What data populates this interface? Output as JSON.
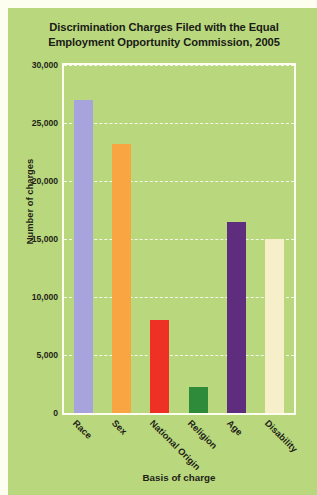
{
  "chart_data": {
    "type": "bar",
    "title": "Discrimination Charges Filed with the Equal Employment Opportunity Commission, 2005",
    "title_lines": [
      "Discrimination Charges Filed with the Equal",
      "Employment Opportunity Commission, 2005"
    ],
    "xlabel": "Basis of charge",
    "ylabel": "Number of charges",
    "categories": [
      "Race",
      "Sex",
      "National Origin",
      "Religion",
      "Age",
      "Disability"
    ],
    "values": [
      27000,
      23200,
      8000,
      2200,
      16500,
      15000
    ],
    "ylim": [
      0,
      30000
    ],
    "ytick_values": [
      0,
      5000,
      10000,
      15000,
      20000,
      25000,
      30000
    ],
    "ytick_labels": [
      "0",
      "5,000",
      "10,000",
      "15,000",
      "20,000",
      "25,000",
      "30,000"
    ],
    "grid": "horizontal-dashed-white",
    "legend": "none",
    "bar_colors": [
      "#a6a3dd",
      "#f9a541",
      "#ee3124",
      "#2e8b3a",
      "#5f2d7e",
      "#f7efc9"
    ],
    "colors": {
      "panel_background": "#b9d87d",
      "figure_background": "#fdfdf0",
      "plot_border": "#fdfdf0",
      "gridline": "#ffffff",
      "text": "#231f18"
    }
  }
}
